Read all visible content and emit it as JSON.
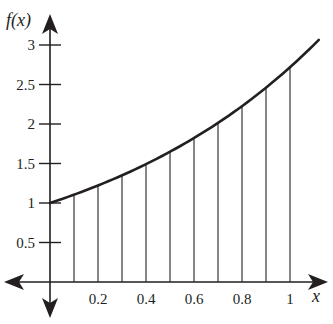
{
  "chart_data": {
    "type": "line",
    "title": "",
    "xlabel": "x",
    "ylabel": "f(x)",
    "function": "e^x",
    "x_ticks": [
      0.2,
      0.4,
      0.6,
      0.8,
      1
    ],
    "x_tick_labels": [
      "0.2",
      "0.4",
      "0.6",
      "0.8",
      "1"
    ],
    "y_ticks": [
      0.5,
      1,
      1.5,
      2,
      2.5,
      3
    ],
    "y_tick_labels": [
      "0.5",
      "1",
      "1.5",
      "2",
      "2.5",
      "3"
    ],
    "xlim": [
      -0.2,
      1.15
    ],
    "ylim": [
      -0.45,
      3.4
    ],
    "grid": false,
    "series": [
      {
        "name": "f(x)",
        "x": [
          0,
          0.1,
          0.2,
          0.3,
          0.4,
          0.5,
          0.6,
          0.7,
          0.8,
          0.9,
          1.0,
          1.12
        ],
        "values": [
          1.0,
          1.105,
          1.221,
          1.35,
          1.492,
          1.649,
          1.822,
          2.014,
          2.226,
          2.46,
          2.718,
          3.06
        ]
      }
    ],
    "vertical_lines_x": [
      0.1,
      0.2,
      0.3,
      0.4,
      0.5,
      0.6,
      0.7,
      0.8,
      0.9,
      1.0
    ],
    "colors": {
      "curve": "#231f20",
      "axes": "#231f20",
      "lines": "#231f20"
    }
  }
}
